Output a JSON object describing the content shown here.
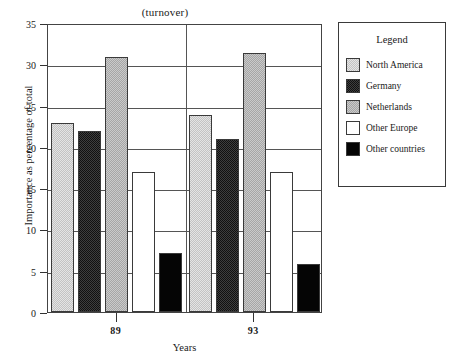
{
  "chart_data": {
    "type": "bar",
    "title": "(turnover)",
    "xlabel": "Years",
    "ylabel": "Importance as percentage of total",
    "categories": [
      "89",
      "93"
    ],
    "ylim": [
      0,
      35
    ],
    "yticks": [
      0,
      5,
      10,
      15,
      20,
      25,
      30,
      35
    ],
    "grid": true,
    "legend_position": "right",
    "legend_title": "Legend",
    "series": [
      {
        "name": "North America",
        "values": [
          22.9,
          23.9
        ],
        "fill": "light-gray-dither",
        "color": "#d2d2d2"
      },
      {
        "name": "Germany",
        "values": [
          21.9,
          21.0
        ],
        "fill": "very-dark-dither",
        "color": "#2a2a2a"
      },
      {
        "name": "Netherlands",
        "values": [
          30.9,
          31.4
        ],
        "fill": "mid-gray-dither",
        "color": "#b6b6b6"
      },
      {
        "name": "Other Europe",
        "values": [
          17.0,
          17.0
        ],
        "fill": "white",
        "color": "#ffffff"
      },
      {
        "name": "Other countries",
        "values": [
          7.1,
          5.85
        ],
        "fill": "solid-black",
        "color": "#050505"
      }
    ]
  }
}
